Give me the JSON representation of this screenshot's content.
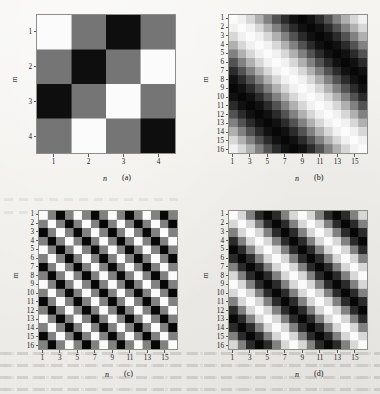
{
  "figure": {
    "background_color": "#f2f1ee",
    "axis_color": "#8e8e8e",
    "text_color": "#1a1a1a",
    "colormap": "gray"
  },
  "chart_data": [
    {
      "type": "heatmap",
      "panel": "a",
      "caption": "(a)",
      "title": "",
      "xlabel": "n",
      "ylabel": "m",
      "rows": 4,
      "cols": 4,
      "xticks": [
        1,
        2,
        3,
        4
      ],
      "yticks": [
        1,
        2,
        3,
        4
      ],
      "xlim": [
        0.5,
        4.5
      ],
      "ylim": [
        0.5,
        4.5
      ],
      "grid": false,
      "legend": "none",
      "cmap": "gray",
      "vmin": -1,
      "vmax": 1,
      "values": [
        [
          1.0,
          -0.1,
          -0.95,
          -0.1
        ],
        [
          -0.1,
          -0.95,
          -0.1,
          1.0
        ],
        [
          -0.95,
          -0.1,
          1.0,
          -0.1
        ],
        [
          -0.1,
          1.0,
          -0.1,
          -0.95
        ]
      ]
    },
    {
      "type": "heatmap",
      "panel": "b",
      "caption": "(b)",
      "title": "",
      "xlabel": "n",
      "ylabel": "m",
      "rows": 16,
      "cols": 16,
      "xticks": [
        1,
        3,
        5,
        7,
        9,
        11,
        13,
        15
      ],
      "yticks": [
        1,
        2,
        3,
        4,
        5,
        6,
        7,
        8,
        9,
        10,
        11,
        12,
        13,
        14,
        15,
        16
      ],
      "xlim": [
        0.5,
        16.5
      ],
      "ylim": [
        0.5,
        16.5
      ],
      "grid": false,
      "legend": "none",
      "cmap": "gray",
      "vmin": -1,
      "vmax": 1,
      "formula": "cos(2*pi*(n - m)/16)",
      "period": 16,
      "orientation": "diagonal"
    },
    {
      "type": "heatmap",
      "panel": "c",
      "caption": "(c)",
      "title": "",
      "xlabel": "n",
      "ylabel": "m",
      "rows": 16,
      "cols": 16,
      "xticks": [
        1,
        3,
        5,
        7,
        9,
        11,
        13,
        15
      ],
      "yticks": [
        1,
        2,
        3,
        4,
        5,
        6,
        7,
        8,
        9,
        10,
        11,
        12,
        13,
        14,
        15,
        16
      ],
      "xlim": [
        0.5,
        16.5
      ],
      "ylim": [
        0.5,
        16.5
      ],
      "grid": false,
      "legend": "none",
      "cmap": "gray",
      "vmin": -1,
      "vmax": 1,
      "formula": "cos(2*pi*(n - m)/4)",
      "period": 4,
      "orientation": "diagonal"
    },
    {
      "type": "heatmap",
      "panel": "d",
      "caption": "(d)",
      "title": "",
      "xlabel": "n",
      "ylabel": "m",
      "rows": 16,
      "cols": 16,
      "xticks": [
        1,
        3,
        5,
        7,
        9,
        11,
        13,
        15
      ],
      "yticks": [
        1,
        2,
        3,
        4,
        5,
        6,
        7,
        8,
        9,
        10,
        11,
        12,
        13,
        14,
        15,
        16
      ],
      "xlim": [
        0.5,
        16.5
      ],
      "ylim": [
        0.5,
        16.5
      ],
      "grid": false,
      "legend": "none",
      "cmap": "gray",
      "vmin": -1,
      "vmax": 1,
      "formula": "cos(2*pi*(n - m)/8)",
      "period": 8,
      "orientation": "diagonal"
    }
  ]
}
